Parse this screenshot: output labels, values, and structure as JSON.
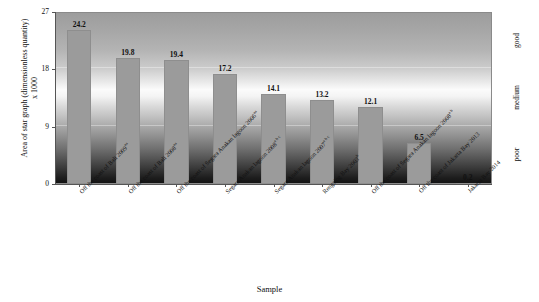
{
  "chart_data": {
    "type": "bar",
    "title": "",
    "xlabel": "Sample",
    "ylabel": "Area of star graph (dimensionless quantity)  x 1000",
    "ylabel_line1": "Area of star graph (dimensionless quantity)",
    "ylabel_line2": "x 1000",
    "ylim": [
      0,
      27
    ],
    "yticks": [
      0,
      9,
      18,
      27
    ],
    "ytick_labels": [
      "0",
      "9",
      "18",
      "27"
    ],
    "grid": true,
    "legend": "none",
    "bar_color": "#9b9b9b",
    "categories": [
      "Off the coast of Bali  2009",
      "Off the coast of Bali  2008",
      "Off the coast of Segara Anakan lagoon  2006",
      "Segara Anakan lagoon  2008",
      "Segara Anakan lagoon  2007",
      "Rengsing Bay  2003",
      "Off the coast of Segara Anakan lagoon  2008",
      "Off the coast of Jakarta Bay  2013",
      "Jakarta Bay  2014"
    ],
    "category_superscripts": [
      "aa",
      "aa",
      "aa",
      "a b c",
      "a b c",
      "b",
      "a b",
      "",
      ""
    ],
    "values": [
      24.2,
      19.8,
      19.4,
      17.2,
      14.1,
      13.2,
      12.1,
      6.5,
      0.2
    ],
    "value_labels": [
      "24.2",
      "19.8",
      "19.4",
      "17.2",
      "14.1",
      "13.2",
      "12.1",
      "6.5",
      "0.2"
    ]
  },
  "quality_scale": {
    "top": "good",
    "middle": "medium",
    "bottom": "poor"
  }
}
